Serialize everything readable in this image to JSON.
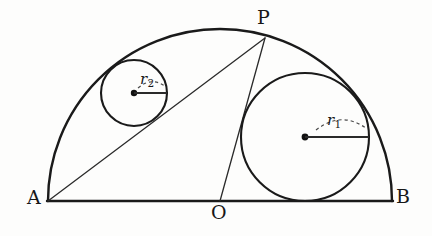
{
  "figure": {
    "kind": "geometry-diagram",
    "background_color": "#fdfdfc",
    "stroke_color": "#1a1a1a",
    "labels": {
      "point_a": "A",
      "point_b": "B",
      "point_o": "O",
      "point_p": "P",
      "radius_large": "r",
      "radius_large_sub": "1",
      "radius_small": "r",
      "radius_small_sub": "2"
    },
    "points": {
      "A": {
        "x": 48,
        "y": 201
      },
      "B": {
        "x": 392,
        "y": 201
      },
      "O": {
        "x": 220,
        "y": 201
      },
      "P": {
        "x": 265,
        "y": 38
      }
    },
    "semicircle": {
      "center_x": 220,
      "center_y": 201,
      "radius": 172
    },
    "circle_large": {
      "name": "circle-r1",
      "center_x": 305,
      "center_y": 137,
      "radius": 64,
      "radius_line_to_x": 369
    },
    "circle_small": {
      "name": "circle-r2",
      "center_x": 134,
      "center_y": 93,
      "radius": 33,
      "radius_line_to_x": 167
    },
    "segments": {
      "diameter": "A-B",
      "chord": "A-P",
      "radius_op": "O-P"
    }
  }
}
